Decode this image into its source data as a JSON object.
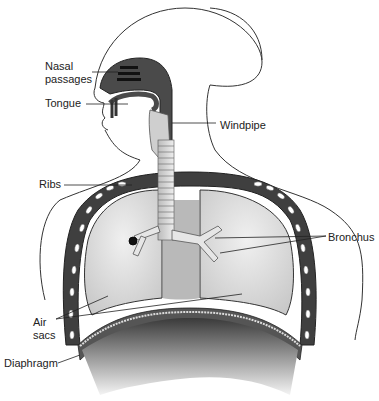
{
  "diagram": {
    "labels": {
      "nasal_passages": [
        "Nasal",
        "passages"
      ],
      "tongue": "Tongue",
      "windpipe": "Windpipe",
      "ribs": "Ribs",
      "bronchus": "Bronchus",
      "air_sacs": [
        "Air",
        "sacs"
      ],
      "diaphragm": "Diaphragm"
    },
    "colors": {
      "dark_tissue": "#4a4a4a",
      "lung_fill": "#dcdcdc",
      "outline": "#333333",
      "rib_white": "#ffffff",
      "background": "#ffffff"
    }
  }
}
